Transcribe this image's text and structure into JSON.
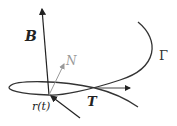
{
  "diagram": {
    "labels": {
      "binormal": "B",
      "normal": "N",
      "tangent": "T",
      "curve": "Γ",
      "position": "r(t)"
    },
    "colors": {
      "curve": "#333333",
      "binormal": "#222222",
      "normal": "#999999",
      "tangent": "#444444",
      "background": "#ffffff"
    },
    "point": {
      "x": 49,
      "y": 95
    }
  }
}
